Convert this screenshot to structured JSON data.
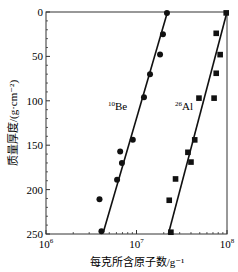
{
  "chart_data": {
    "type": "scatter",
    "title": "",
    "xlabel": "每克所含原子数/g⁻¹",
    "ylabel": "质量厚度/(g·cm⁻²)",
    "xscale": "log",
    "xlim": [
      1000000,
      100000000
    ],
    "ylim": [
      250,
      0
    ],
    "y_inverted": true,
    "x_ticks": [
      {
        "value": 1000000,
        "base": "10",
        "exp": "6"
      },
      {
        "value": 10000000,
        "base": "10",
        "exp": "7"
      },
      {
        "value": 100000000,
        "base": "10",
        "exp": "8"
      }
    ],
    "y_ticks": [
      "0",
      "50",
      "100",
      "150",
      "200",
      "250"
    ],
    "grid": false,
    "series": [
      {
        "name": "10Be",
        "label_sup": "10",
        "label_main": "Be",
        "marker": "circle",
        "points": [
          {
            "x": 21700000,
            "y": 1
          },
          {
            "x": 19600000,
            "y": 25
          },
          {
            "x": 18200000,
            "y": 48
          },
          {
            "x": 14100000,
            "y": 70
          },
          {
            "x": 12100000,
            "y": 96
          },
          {
            "x": 9100000,
            "y": 144
          },
          {
            "x": 6600000,
            "y": 157
          },
          {
            "x": 6900000,
            "y": 170
          },
          {
            "x": 6100000,
            "y": 189
          },
          {
            "x": 3900000,
            "y": 211
          },
          {
            "x": 4100000,
            "y": 247
          }
        ],
        "fit_line": [
          {
            "x": 22000000,
            "y": 0
          },
          {
            "x": 4300000,
            "y": 248
          }
        ]
      },
      {
        "name": "26Al",
        "label_sup": "26",
        "label_main": "Al",
        "marker": "square",
        "points": [
          {
            "x": 98000000,
            "y": 1
          },
          {
            "x": 76000000,
            "y": 24
          },
          {
            "x": 84000000,
            "y": 48
          },
          {
            "x": 76000000,
            "y": 69
          },
          {
            "x": 49000000,
            "y": 97
          },
          {
            "x": 72000000,
            "y": 97
          },
          {
            "x": 44000000,
            "y": 144
          },
          {
            "x": 37000000,
            "y": 158
          },
          {
            "x": 40000000,
            "y": 169
          },
          {
            "x": 27000000,
            "y": 188
          },
          {
            "x": 23000000,
            "y": 212
          },
          {
            "x": 24000000,
            "y": 248
          }
        ],
        "fit_line": [
          {
            "x": 100000000,
            "y": 0
          },
          {
            "x": 22500000,
            "y": 250
          }
        ]
      }
    ]
  }
}
